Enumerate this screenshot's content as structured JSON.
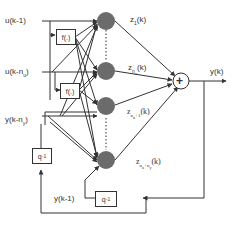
{
  "diagram": {
    "inputs": {
      "u_k1": "u(k-1)",
      "u_knu": "u(k-n",
      "u_knu_sub": "u",
      "y_kny": "y(k-n",
      "y_kny_sub": "y"
    },
    "blocks": {
      "f1": "f(.)",
      "f2": "f(.)",
      "q1_left": "q",
      "q1_left_sup": "-1",
      "q1_bottom": "q",
      "q1_bottom_sup": "-1"
    },
    "outputs": {
      "z1": "z",
      "z1_sub": "1",
      "z1_tail": "(k)",
      "znu": "z",
      "znu_sub": "n",
      "znu_subsub": "u",
      "znu_tail": "(k)",
      "znu1": "z",
      "znu1_sub": "n",
      "znu1_subsub": "u",
      "znu1_plus": "+1",
      "znu1_tail": "(k)",
      "znuny": "z",
      "znuny_sub": "n",
      "znuny_subsub": "u",
      "znuny_plus": "+n",
      "znuny_plus_sub": "y",
      "znuny_tail": "(k)",
      "y_k": "y(k)",
      "y_k1": "y(k-1)"
    },
    "summer": "+",
    "colors": {
      "neuron": "#6b6b6b",
      "line": "#333333"
    }
  }
}
